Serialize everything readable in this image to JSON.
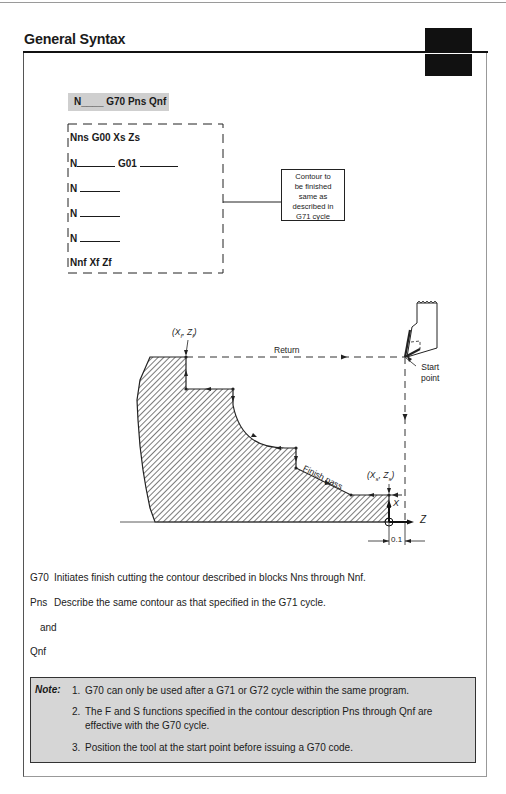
{
  "header": {
    "title": "General Syntax"
  },
  "syntax": {
    "command": "N____ G70 Pns Qnf"
  },
  "program_blocks": [
    {
      "prefix": "Nns G00 Xs Zs",
      "blank1": 0,
      "mid": "",
      "blank2": 0
    },
    {
      "prefix": "N",
      "blank1": 40,
      "mid": " G01 ",
      "blank2": 40
    },
    {
      "prefix": "N ",
      "blank1": 40,
      "mid": "",
      "blank2": 0
    },
    {
      "prefix": "N ",
      "blank1": 40,
      "mid": "",
      "blank2": 0
    },
    {
      "prefix": "N ",
      "blank1": 40,
      "mid": "",
      "blank2": 0
    },
    {
      "prefix": "Nnf Xf Zf",
      "blank1": 0,
      "mid": "",
      "blank2": 0
    }
  ],
  "callout": {
    "lines": [
      "Contour to",
      "be finished",
      "same as",
      "described in",
      "G71 cycle"
    ]
  },
  "diagram": {
    "end_point_label": {
      "x": "X",
      "xsub": "f",
      "z": "Z",
      "zsub": "f"
    },
    "return_label": "Return",
    "start_point_label": [
      "Start",
      "point"
    ],
    "finish_pass_label": "Finish pass",
    "start_coord_label": {
      "x": "X",
      "xsub": "s",
      "z": "Z",
      "zsub": "s"
    },
    "axis_x_label": "X",
    "axis_z_label": "Z",
    "clearance_dimension": "0.1"
  },
  "descriptions": [
    {
      "key": "G70",
      "text": "Initiates finish cutting the contour described in blocks Nns through Nnf."
    },
    {
      "key": "Pns",
      "text": "Describe the same contour as that specified in the G71 cycle."
    },
    {
      "key": "",
      "text": "and"
    },
    {
      "key": "Qnf",
      "text": ""
    }
  ],
  "note": {
    "label": "Note:",
    "items": [
      {
        "num": "1.",
        "text": "G70 can only be used after a G71 or G72 cycle within the same program."
      },
      {
        "num": "2.",
        "text": "The F and S functions specified in the contour description Pns through Qnf are effective with the G70 cycle."
      },
      {
        "num": "3.",
        "text": "Position the tool at the start point before issuing a G70 code."
      }
    ]
  },
  "colors": {
    "note_background": "#d6d6d6",
    "syntax_background": "#cfcfcf",
    "ink": "#1a1a1a"
  }
}
